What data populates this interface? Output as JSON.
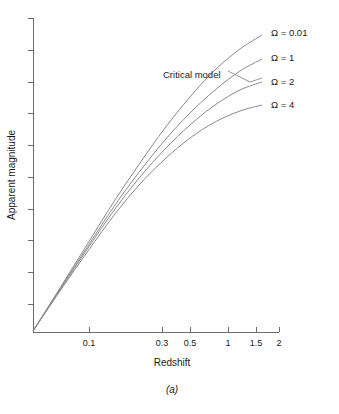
{
  "figure": {
    "caption": "(a)",
    "background": "#ffffff",
    "line_color": "#8a8a8a",
    "axis_color": "#6b6b6b"
  },
  "chart_data": {
    "type": "line",
    "title": "",
    "xlabel": "Redshift",
    "ylabel": "Apparent magnitude",
    "xscale": "log",
    "xlim": [
      0.04,
      2.0
    ],
    "ylim": [
      0,
      1
    ],
    "grid": false,
    "legend_position": "right-inline-labels",
    "xticks": [
      0.1,
      0.3,
      0.5,
      1,
      1.5,
      2
    ],
    "xticklabels": [
      "0.1",
      "0.3",
      "0.5",
      "1",
      "1.5",
      "2"
    ],
    "yticks_count": 10,
    "yticklabels": [],
    "annotations": [
      {
        "text": "Critical model",
        "points_to_series": "Ω = 1",
        "x_px": 163,
        "y_px": 75
      }
    ],
    "series": [
      {
        "name": "Ω = 0.01",
        "label": "Ω = 0.01",
        "label_x_px": 271,
        "label_y_px": 33,
        "points_px": [
          [
            33,
            331
          ],
          [
            60,
            288
          ],
          [
            88,
            243
          ],
          [
            115,
            200
          ],
          [
            140,
            163
          ],
          [
            165,
            128
          ],
          [
            190,
            97
          ],
          [
            215,
            70
          ],
          [
            240,
            49
          ],
          [
            262,
            35
          ]
        ]
      },
      {
        "name": "Ω = 1",
        "label": "Ω = 1",
        "label_x_px": 271,
        "label_y_px": 58,
        "points_px": [
          [
            33,
            331
          ],
          [
            60,
            289
          ],
          [
            88,
            246
          ],
          [
            115,
            205
          ],
          [
            140,
            171
          ],
          [
            165,
            140
          ],
          [
            190,
            113
          ],
          [
            215,
            90
          ],
          [
            240,
            71
          ],
          [
            262,
            59
          ]
        ]
      },
      {
        "name": "Ω = 2",
        "label": "Ω = 2",
        "label_x_px": 271,
        "label_y_px": 82,
        "points_px": [
          [
            33,
            331
          ],
          [
            60,
            290
          ],
          [
            88,
            248
          ],
          [
            115,
            209
          ],
          [
            140,
            177
          ],
          [
            165,
            149
          ],
          [
            190,
            125
          ],
          [
            215,
            105
          ],
          [
            240,
            90
          ],
          [
            262,
            82
          ]
        ]
      },
      {
        "name": "Ω = 4",
        "label": "Ω = 4",
        "label_x_px": 271,
        "label_y_px": 105,
        "points_px": [
          [
            33,
            331
          ],
          [
            60,
            291
          ],
          [
            88,
            251
          ],
          [
            115,
            214
          ],
          [
            140,
            184
          ],
          [
            165,
            159
          ],
          [
            190,
            138
          ],
          [
            215,
            122
          ],
          [
            240,
            111
          ],
          [
            262,
            105
          ]
        ]
      }
    ],
    "x_axis_px": {
      "x0": 33,
      "x1": 279,
      "y": 332
    },
    "y_axis_px": {
      "y0": 18,
      "y1": 332,
      "x": 33
    },
    "xtick_px": [
      89,
      162,
      190,
      228,
      256,
      279
    ],
    "ytick_px": [
      18,
      50,
      82,
      113,
      145,
      177,
      209,
      240,
      272,
      304
    ]
  }
}
